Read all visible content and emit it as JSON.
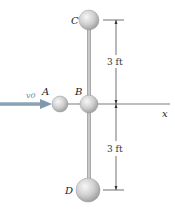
{
  "diagram": {
    "labels": {
      "ball_a": "A",
      "ball_b": "B",
      "ball_c": "C",
      "ball_d": "D",
      "velocity": "v0",
      "axis": "x"
    },
    "dimensions": {
      "upper": "3 ft",
      "lower": "3 ft"
    },
    "colors": {
      "ball_fill": "#c8c8c8",
      "ball_highlight": "#f2f2f2",
      "rod": "#a8a8a8",
      "arrow": "#8aa4b8",
      "line": "#333333"
    }
  }
}
